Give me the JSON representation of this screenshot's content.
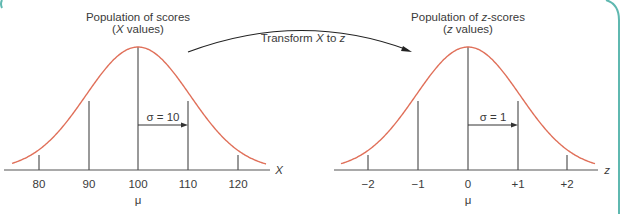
{
  "chart_data": [
    {
      "type": "line",
      "title": "Population of scores",
      "subtitle": "(X values)",
      "xlabel": "X",
      "mean_label": "μ",
      "sd_annotation": "σ = 10",
      "mean": 100,
      "sd": 10,
      "ticks": [
        "80",
        "90",
        "100",
        "110",
        "120"
      ],
      "tick_values": [
        80,
        90,
        100,
        110,
        120
      ],
      "distribution": "normal"
    },
    {
      "type": "line",
      "title": "Population of z-scores",
      "subtitle": "(z values)",
      "xlabel": "z",
      "mean_label": "μ",
      "sd_annotation": "σ = 1",
      "mean": 0,
      "sd": 1,
      "ticks": [
        "−2",
        "−1",
        "0",
        "+1",
        "+2"
      ],
      "tick_values": [
        -2,
        -1,
        0,
        1,
        2
      ],
      "distribution": "normal"
    }
  ],
  "transform_label": {
    "pre": "Transform ",
    "x": "X",
    "mid": " to ",
    "z": "z"
  },
  "left": {
    "title": "Population of scores",
    "sub_pre": "(",
    "sub_var": "X",
    "sub_post": " values)"
  },
  "right": {
    "title_var": "z",
    "title_post": "-scores",
    "title_pre": "Population of ",
    "sub_pre": "(",
    "sub_var": "z",
    "sub_post": " values)"
  },
  "colors": {
    "curve": "#e0705a",
    "line": "#555555",
    "border": "#5fb8b0"
  }
}
